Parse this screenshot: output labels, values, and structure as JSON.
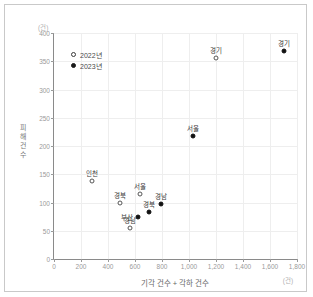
{
  "chart_data": {
    "type": "scatter",
    "title": "",
    "xlabel": "기각 건수 + 각하 건수",
    "ylabel": "피해 건수",
    "x_unit": "(건)",
    "y_unit": "(건)",
    "xlim": [
      0,
      1800
    ],
    "ylim": [
      0,
      400
    ],
    "xticks": [
      "0",
      "200",
      "400",
      "600",
      "800",
      "1,000",
      "1,200",
      "1,400",
      "1,600",
      "1,800"
    ],
    "xtick_values": [
      0,
      200,
      400,
      600,
      800,
      1000,
      1200,
      1400,
      1600,
      1800
    ],
    "yticks": [
      "0",
      "50",
      "100",
      "150",
      "200",
      "250",
      "300",
      "350",
      "400"
    ],
    "ytick_values": [
      0,
      50,
      100,
      150,
      200,
      250,
      300,
      350,
      400
    ],
    "grid": true,
    "legend_position": "top-left",
    "series": [
      {
        "name": "2022년",
        "marker": "open-circle",
        "points": [
          {
            "label": "경기",
            "x": 1200,
            "y": 355,
            "label_pos": "above"
          },
          {
            "label": "서울",
            "x": 640,
            "y": 115,
            "label_pos": "above"
          },
          {
            "label": "인천",
            "x": 280,
            "y": 138,
            "label_pos": "above"
          },
          {
            "label": "경북",
            "x": 490,
            "y": 100,
            "label_pos": "above"
          },
          {
            "label": "경남",
            "x": 560,
            "y": 55,
            "label_pos": "above"
          }
        ]
      },
      {
        "name": "2023년",
        "marker": "filled-circle",
        "points": [
          {
            "label": "경기",
            "x": 1700,
            "y": 368,
            "label_pos": "above"
          },
          {
            "label": "서울",
            "x": 1030,
            "y": 218,
            "label_pos": "above"
          },
          {
            "label": "경남",
            "x": 790,
            "y": 97,
            "label_pos": "above"
          },
          {
            "label": "경북",
            "x": 700,
            "y": 83,
            "label_pos": "above"
          },
          {
            "label": "부산",
            "x": 620,
            "y": 75,
            "label_pos": "left"
          }
        ]
      }
    ]
  },
  "legend": {
    "items": [
      {
        "label": "2022년",
        "marker": "open"
      },
      {
        "label": "2023년",
        "marker": "filled"
      }
    ]
  },
  "axes": {
    "x_title": "기각 건수 + 각하 건수",
    "y_title": "피해 건수",
    "x_unit": "(건)",
    "y_unit": "(건)"
  },
  "colors": {
    "series_2022": "#ffffff",
    "series_2023": "#111111",
    "marker_stroke": "#555555",
    "axis": "#8a8a8a",
    "grid": "#eeeeee",
    "tick_text": "#9a9a9a",
    "frame": "#c9c9c9"
  }
}
